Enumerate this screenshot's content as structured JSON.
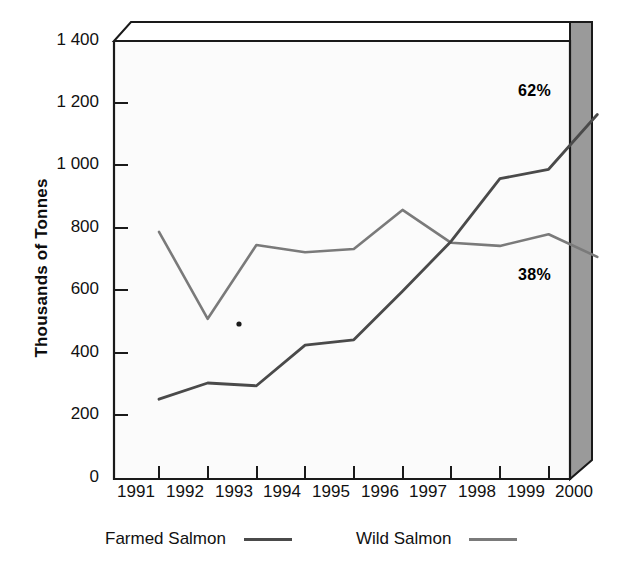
{
  "chart_data": {
    "type": "line",
    "title": "",
    "xlabel": "",
    "ylabel": "Thousands of Tonnes",
    "categories": [
      "1991",
      "1992",
      "1993",
      "1994",
      "1995",
      "1996",
      "1997",
      "1998",
      "1999",
      "2000"
    ],
    "ylim": [
      0,
      1400
    ],
    "ytick_labels": [
      "0",
      "200",
      "400",
      "600",
      "800",
      "1 000",
      "1 200",
      "1 400"
    ],
    "ytick_values": [
      0,
      200,
      400,
      600,
      800,
      1000,
      1200,
      1400
    ],
    "grid": false,
    "legend_position": "bottom",
    "series": [
      {
        "name": "Farmed Salmon",
        "color": "#4a4a4a",
        "values": [
          255,
          307,
          298,
          428,
          445,
          600,
          760,
          960,
          990,
          1165
        ],
        "annotation": "62%"
      },
      {
        "name": "Wild Salmon",
        "color": "#7a7a7a",
        "values": [
          790,
          512,
          748,
          725,
          735,
          860,
          755,
          745,
          782,
          710
        ],
        "annotation": "38%"
      }
    ]
  },
  "axis": {
    "y_title": "Thousands of Tonnes"
  },
  "annotations": {
    "farmed_pct": "62%",
    "wild_pct": "38%"
  },
  "legend": {
    "entries": [
      {
        "label": "Farmed Salmon",
        "color": "#4a4a4a"
      },
      {
        "label": "Wild Salmon",
        "color": "#7a7a7a"
      }
    ]
  },
  "colors": {
    "plot_background": "#fbfbfb",
    "frame_line": "#1a1a1a",
    "side_panel": "#9a9a9a",
    "top_panel": "#ffffff",
    "farmed_line": "#4a4a4a",
    "wild_line": "#7a7a7a"
  }
}
